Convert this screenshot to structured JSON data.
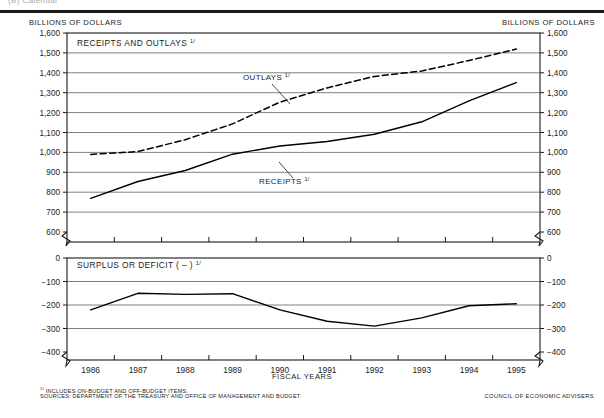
{
  "page": {
    "clipped_header": "(B) Calendar",
    "fiscal_years_label": "FISCAL YEARS",
    "credit": "COUNCIL OF ECONOMIC ADVISERS",
    "footnote_marker": "1/",
    "footnote_1": "INCLUDES ON-BUDGET AND OFF-BUDGET ITEMS.",
    "footnote_2": "SOURCES: DEPARTMENT OF THE TREASURY AND OFFICE OF MANAGEMENT AND BUDGET.",
    "unit_left": "BILLIONS OF DOLLARS",
    "unit_right": "BILLIONS OF DOLLARS"
  },
  "colors": {
    "ink": "#1b1b1b",
    "grid": "#555555",
    "line": "#000000"
  },
  "chart_data": [
    {
      "type": "line",
      "title": "RECEIPTS AND OUTLAYS",
      "title_footnote": "1/",
      "xlabel": "FISCAL YEARS",
      "ylabel": "BILLIONS OF DOLLARS",
      "x": [
        1986,
        1987,
        1988,
        1989,
        1990,
        1991,
        1992,
        1993,
        1994,
        1995
      ],
      "categories": [
        "1986",
        "1987",
        "1988",
        "1989",
        "1990",
        "1991",
        "1992",
        "1993",
        "1994",
        "1995"
      ],
      "ylim": [
        600,
        1600
      ],
      "yticks": [
        600,
        700,
        800,
        900,
        1000,
        1100,
        1200,
        1300,
        1400,
        1500,
        1600
      ],
      "ytick_labels": [
        "600",
        "700",
        "800",
        "900",
        "1,000",
        "1,100",
        "1,200",
        "1,300",
        "1,400",
        "1,500",
        "1,600"
      ],
      "axis_break": true,
      "grid": true,
      "legend": "inline-annotations",
      "series": [
        {
          "name": "OUTLAYS",
          "footnote": "1/",
          "style": "dashed",
          "values": [
            990,
            1004,
            1064,
            1143,
            1253,
            1324,
            1382,
            1409,
            1462,
            1519
          ]
        },
        {
          "name": "RECEIPTS",
          "footnote": "1/",
          "style": "solid",
          "values": [
            769,
            854,
            909,
            991,
            1032,
            1055,
            1091,
            1154,
            1259,
            1351
          ]
        }
      ]
    },
    {
      "type": "line",
      "title": "SURPLUS OR DEFICIT ( – )",
      "title_footnote": "1/",
      "xlabel": "FISCAL YEARS",
      "ylabel": "BILLIONS OF DOLLARS",
      "x": [
        1986,
        1987,
        1988,
        1989,
        1990,
        1991,
        1992,
        1993,
        1994,
        1995
      ],
      "categories": [
        "1986",
        "1987",
        "1988",
        "1989",
        "1990",
        "1991",
        "1992",
        "1993",
        "1994",
        "1995"
      ],
      "ylim": [
        -400,
        0
      ],
      "yticks": [
        -400,
        -300,
        -200,
        -100,
        0
      ],
      "ytick_labels": [
        "−400",
        "−300",
        "−200",
        "−100",
        "0"
      ],
      "axis_break": true,
      "grid": true,
      "series": [
        {
          "name": "SURPLUS OR DEFICIT (−)",
          "footnote": "1/",
          "style": "solid",
          "values": [
            -221,
            -150,
            -155,
            -152,
            -221,
            -269,
            -290,
            -255,
            -203,
            -195
          ]
        }
      ]
    }
  ]
}
